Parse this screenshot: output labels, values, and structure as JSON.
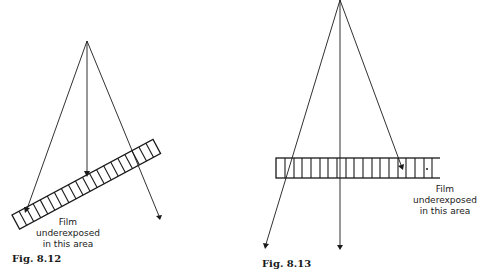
{
  "figures": [
    {
      "id": "fig-8-12",
      "caption": "Fig. 8.12",
      "label_lines": [
        "Film",
        "underexposed",
        "in this area"
      ],
      "source_apex": [
        87,
        41
      ],
      "rays_end": [
        [
          26,
          211
        ],
        [
          87,
          176
        ],
        [
          159,
          219
        ]
      ],
      "film": {
        "orientation": "tilted",
        "cells": 20
      }
    },
    {
      "id": "fig-8-13",
      "caption": "Fig. 8.13",
      "label_lines": [
        "Film",
        "underexposed",
        "in this area"
      ],
      "source_apex": [
        340,
        0
      ],
      "rays_end": [
        [
          266,
          247
        ],
        [
          340,
          248
        ],
        [
          402,
          168
        ]
      ],
      "film": {
        "orientation": "horizontal",
        "cells": 20
      }
    }
  ],
  "colors": {
    "ink": "#1a1a1a",
    "background": "#ffffff"
  }
}
